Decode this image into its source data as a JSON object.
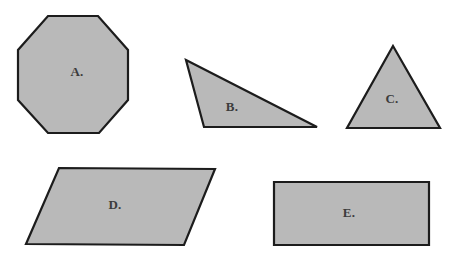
{
  "figure": {
    "width": 464,
    "height": 257,
    "background_color": "#ffffff",
    "shape_fill_color": "#b9b9b9",
    "shape_stroke_color": "#1c1c1c",
    "label_color": "#3c3c3c",
    "stroke_width": 2.2
  },
  "shapes": [
    {
      "id": "octagon",
      "label": "A.",
      "kind": "octagon",
      "points": "48,16 98,16 128,50 128,100 99,133 48,133 18,100 18,50",
      "label_x": 77,
      "label_y": 73
    },
    {
      "id": "scalene-triangle",
      "label": "B.",
      "kind": "triangle",
      "points": "186,60 317,127 204,127",
      "label_x": 232,
      "label_y": 108
    },
    {
      "id": "isosceles-triangle",
      "label": "C.",
      "kind": "triangle",
      "points": "393,46 440,128 347,128",
      "label_x": 392,
      "label_y": 100
    },
    {
      "id": "parallelogram",
      "label": "D.",
      "kind": "parallelogram",
      "points": "59,168 215,169 184,245 26,244",
      "label_x": 115,
      "label_y": 206
    },
    {
      "id": "rectangle",
      "label": "E.",
      "kind": "rectangle",
      "points": "274,182 429,182 429,245 274,245",
      "label_x": 349,
      "label_y": 214
    }
  ]
}
